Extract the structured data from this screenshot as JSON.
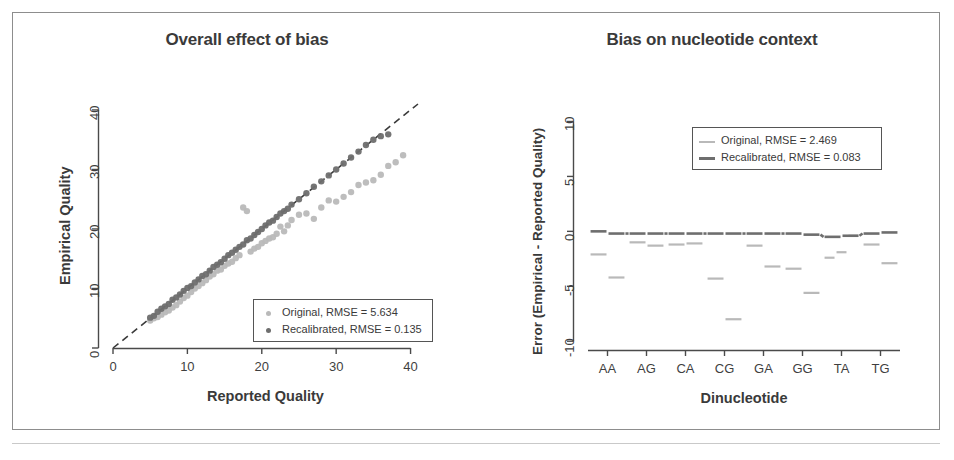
{
  "figure": {
    "background": "#ffffff",
    "frame_color": "#8d8d8d"
  },
  "colors": {
    "original": "#b9b9b9",
    "recalibrated": "#6e6e6e",
    "identity_line": "#3a3a3a",
    "axis": "#4a4a4a",
    "text": "#3a3a3a"
  },
  "panels": {
    "left": {
      "title": "Overall effect of bias",
      "xlabel": "Reported Quality",
      "ylabel": "Empirical Quality",
      "legend": {
        "original": "Original, RMSE = 5.634",
        "recalibrated": "Recalibrated, RMSE = 0.135"
      }
    },
    "right": {
      "title": "Bias on nucleotide context",
      "xlabel": "Dinucleotide",
      "ylabel": "Error (Empirical - Reported Quality)",
      "legend": {
        "original": "Original, RMSE = 2.469",
        "recalibrated": "Recalibrated, RMSE = 0.083"
      }
    }
  },
  "chart_data": [
    {
      "id": "overall-effect-of-bias",
      "type": "scatter",
      "title": "Overall effect of bias",
      "xlabel": "Reported Quality",
      "ylabel": "Empirical Quality",
      "xlim": [
        0,
        41
      ],
      "ylim": [
        0,
        41
      ],
      "xticks": [
        0,
        10,
        20,
        30,
        40
      ],
      "yticks": [
        0,
        10,
        20,
        30,
        40
      ],
      "grid": false,
      "legend_position": "bottom-right",
      "annotations": [
        {
          "kind": "line",
          "label": "identity line y = x",
          "style": "dashed",
          "from": [
            0,
            0
          ],
          "to": [
            41,
            41
          ]
        }
      ],
      "series": [
        {
          "name": "Original, RMSE = 5.634",
          "color": "#b9b9b9",
          "marker": "circle",
          "x": [
            5,
            5.5,
            6,
            6.5,
            7,
            7.5,
            8,
            8.5,
            9,
            9.5,
            10,
            10.5,
            11,
            11.5,
            12,
            12.5,
            13,
            13.5,
            14,
            14.5,
            15,
            15.5,
            16,
            16.5,
            17,
            17.5,
            18,
            18.5,
            19,
            19.5,
            20,
            20.5,
            21,
            21.5,
            22,
            22.5,
            23,
            23.5,
            24,
            25,
            26,
            27,
            28,
            29,
            30,
            31,
            32,
            33,
            34,
            35,
            36,
            37,
            38,
            39
          ],
          "y": [
            4.6,
            5.0,
            5.2,
            5.6,
            6.0,
            6.3,
            6.8,
            7.2,
            7.8,
            8.4,
            8.8,
            9.4,
            10.0,
            10.4,
            10.9,
            11.4,
            12.0,
            12.4,
            13.0,
            13.2,
            13.8,
            14.2,
            14.5,
            15.1,
            15.6,
            23.6,
            23.0,
            16.2,
            16.7,
            17.0,
            17.6,
            18.0,
            18.4,
            18.6,
            19.2,
            20.4,
            19.6,
            20.6,
            21.5,
            22.4,
            22.6,
            21.7,
            23.6,
            24.8,
            24.6,
            25.4,
            26.2,
            27.4,
            27.8,
            28.2,
            29.1,
            30.6,
            31.2,
            32.4
          ]
        },
        {
          "name": "Recalibrated, RMSE = 0.135",
          "color": "#6e6e6e",
          "marker": "circle",
          "x": [
            5,
            5.5,
            6,
            6.5,
            7,
            7.5,
            8,
            8.5,
            9,
            9.5,
            10,
            10.5,
            11,
            11.5,
            12,
            12.5,
            13,
            13.5,
            14,
            14.5,
            15,
            15.5,
            16,
            16.5,
            17,
            17.5,
            18,
            18.5,
            19,
            19.5,
            20,
            20.5,
            21,
            21.5,
            22,
            22.5,
            23,
            23.5,
            24,
            25,
            26,
            27,
            28,
            29,
            30,
            31,
            32,
            33,
            34,
            35,
            36,
            37
          ],
          "y": [
            5.1,
            5.4,
            6.1,
            6.6,
            7.0,
            7.4,
            8.1,
            8.5,
            9.0,
            9.6,
            10.1,
            10.4,
            11.0,
            11.5,
            12.1,
            12.4,
            13.0,
            13.6,
            14.0,
            14.4,
            15.0,
            15.6,
            16.0,
            16.5,
            17.0,
            17.4,
            18.1,
            18.4,
            19.0,
            19.5,
            20.0,
            20.6,
            21.1,
            21.4,
            22.0,
            22.6,
            23.0,
            23.4,
            24.1,
            25.0,
            26.0,
            27.1,
            28.0,
            29.0,
            30.0,
            31.0,
            32.0,
            33.0,
            34.1,
            35.0,
            35.6,
            35.9
          ]
        }
      ]
    },
    {
      "id": "bias-on-nucleotide-context",
      "type": "line",
      "subtype": "stepped-segments",
      "title": "Bias on nucleotide context",
      "xlabel": "Dinucleotide",
      "ylabel": "Error (Empirical - Reported Quality)",
      "categories": [
        "AA",
        "AG",
        "CA",
        "CG",
        "GA",
        "GG",
        "TA",
        "TG"
      ],
      "xticks": [
        "AA",
        "AG",
        "CA",
        "CG",
        "GA",
        "GG",
        "TA",
        "TG"
      ],
      "yticks": [
        -10,
        -5,
        0,
        5,
        10
      ],
      "ylim": [
        -10.8,
        10.5
      ],
      "grid": false,
      "legend_position": "top-right",
      "series": [
        {
          "name": "Original, RMSE = 2.469",
          "color": "#b9b9b9",
          "values_by_category": {
            "AA": [
              -2.1,
              -4.2
            ],
            "AG": [
              -1.0,
              -1.3
            ],
            "CA": [
              -1.2,
              -1.1
            ],
            "CG": [
              -4.3,
              -8.0
            ],
            "GA": [
              -1.3,
              -3.2
            ],
            "GG": [
              -3.4,
              -5.6
            ],
            "TA": [
              -2.4,
              -1.9,
              -0.4
            ],
            "TG": [
              -1.2,
              -2.9
            ]
          }
        },
        {
          "name": "Recalibrated, RMSE = 0.083",
          "color": "#6e6e6e",
          "values_by_category": {
            "AA": [
              0.0,
              -0.2
            ],
            "AG": [
              -0.2,
              -0.2
            ],
            "CA": [
              -0.2,
              -0.2
            ],
            "CG": [
              -0.2,
              -0.2
            ],
            "GA": [
              -0.2,
              -0.2
            ],
            "GG": [
              -0.2,
              -0.3
            ],
            "TA": [
              -0.5,
              -0.4
            ],
            "TG": [
              -0.2,
              -0.1
            ]
          }
        }
      ]
    }
  ]
}
